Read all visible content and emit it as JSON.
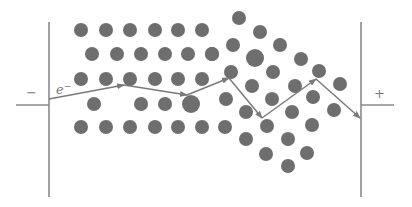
{
  "labels": {
    "negative_terminal": "−",
    "positive_terminal": "+",
    "electron_symbol": "e",
    "electron_charge": "−"
  },
  "colors": {
    "atom": "#6e6e6e",
    "line": "#8a8a8a",
    "background": "#ffffff"
  },
  "electrodes": {
    "left": {
      "x": 49,
      "y_top": 22,
      "y_bottom": 197,
      "lead_x": 16,
      "lead_y": 105
    },
    "right": {
      "x": 361,
      "y_top": 22,
      "y_bottom": 197,
      "lead_x": 394,
      "lead_y": 105
    }
  },
  "atoms": [
    {
      "x": 81,
      "y": 30,
      "r": 7
    },
    {
      "x": 106,
      "y": 30,
      "r": 7
    },
    {
      "x": 130,
      "y": 30,
      "r": 7
    },
    {
      "x": 155,
      "y": 30,
      "r": 7
    },
    {
      "x": 178,
      "y": 30,
      "r": 7
    },
    {
      "x": 202,
      "y": 30,
      "r": 7
    },
    {
      "x": 92,
      "y": 54,
      "r": 7
    },
    {
      "x": 117,
      "y": 54,
      "r": 7
    },
    {
      "x": 141,
      "y": 54,
      "r": 7
    },
    {
      "x": 165,
      "y": 54,
      "r": 7
    },
    {
      "x": 188,
      "y": 54,
      "r": 7
    },
    {
      "x": 212,
      "y": 54,
      "r": 7
    },
    {
      "x": 81,
      "y": 79,
      "r": 7
    },
    {
      "x": 106,
      "y": 79,
      "r": 7
    },
    {
      "x": 130,
      "y": 79,
      "r": 7
    },
    {
      "x": 155,
      "y": 79,
      "r": 7
    },
    {
      "x": 178,
      "y": 79,
      "r": 7
    },
    {
      "x": 202,
      "y": 79,
      "r": 7
    },
    {
      "x": 94,
      "y": 104,
      "r": 7
    },
    {
      "x": 141,
      "y": 104,
      "r": 7
    },
    {
      "x": 165,
      "y": 104,
      "r": 7
    },
    {
      "x": 191,
      "y": 104,
      "r": 9
    },
    {
      "x": 81,
      "y": 127,
      "r": 7
    },
    {
      "x": 106,
      "y": 127,
      "r": 7
    },
    {
      "x": 130,
      "y": 127,
      "r": 7
    },
    {
      "x": 155,
      "y": 127,
      "r": 7
    },
    {
      "x": 178,
      "y": 127,
      "r": 7
    },
    {
      "x": 202,
      "y": 127,
      "r": 7
    },
    {
      "x": 225,
      "y": 127,
      "r": 7
    },
    {
      "x": 239,
      "y": 18,
      "r": 7
    },
    {
      "x": 260,
      "y": 32,
      "r": 7
    },
    {
      "x": 233,
      "y": 45,
      "r": 7
    },
    {
      "x": 280,
      "y": 45,
      "r": 7
    },
    {
      "x": 212,
      "y": 54,
      "r": 7
    },
    {
      "x": 255,
      "y": 58,
      "r": 9
    },
    {
      "x": 301,
      "y": 59,
      "r": 7
    },
    {
      "x": 231,
      "y": 72,
      "r": 7
    },
    {
      "x": 273,
      "y": 72,
      "r": 7
    },
    {
      "x": 319,
      "y": 71,
      "r": 7
    },
    {
      "x": 252,
      "y": 86,
      "r": 7
    },
    {
      "x": 295,
      "y": 86,
      "r": 7
    },
    {
      "x": 340,
      "y": 84,
      "r": 7
    },
    {
      "x": 226,
      "y": 99,
      "r": 7
    },
    {
      "x": 272,
      "y": 99,
      "r": 7
    },
    {
      "x": 313,
      "y": 97,
      "r": 7
    },
    {
      "x": 246,
      "y": 112,
      "r": 7
    },
    {
      "x": 292,
      "y": 112,
      "r": 7
    },
    {
      "x": 334,
      "y": 110,
      "r": 7
    },
    {
      "x": 267,
      "y": 126,
      "r": 7
    },
    {
      "x": 312,
      "y": 125,
      "r": 7
    },
    {
      "x": 246,
      "y": 139,
      "r": 7
    },
    {
      "x": 288,
      "y": 139,
      "r": 7
    },
    {
      "x": 266,
      "y": 154,
      "r": 7
    },
    {
      "x": 307,
      "y": 153,
      "r": 7
    },
    {
      "x": 288,
      "y": 166,
      "r": 7
    }
  ],
  "electron_path": [
    {
      "x": 49,
      "y": 99
    },
    {
      "x": 124,
      "y": 85
    },
    {
      "x": 187,
      "y": 95
    },
    {
      "x": 229,
      "y": 78
    },
    {
      "x": 262,
      "y": 118
    },
    {
      "x": 316,
      "y": 79
    },
    {
      "x": 360,
      "y": 118
    }
  ]
}
